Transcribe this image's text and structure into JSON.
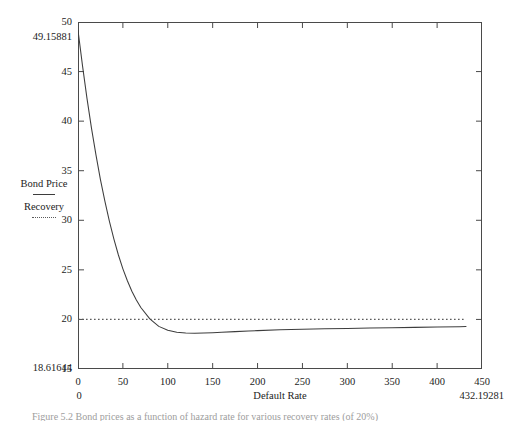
{
  "chart_data": {
    "type": "line",
    "title": "",
    "xlabel": "Default Rate",
    "ylabel": "",
    "xlim": [
      0,
      450
    ],
    "ylim": [
      15,
      50
    ],
    "grid": false,
    "legend_position": "left-outside",
    "xticks": [
      "0",
      "50",
      "100",
      "150",
      "200",
      "250",
      "300",
      "350",
      "400",
      "450"
    ],
    "xtick_values": [
      0,
      50,
      100,
      150,
      200,
      250,
      300,
      350,
      400,
      450
    ],
    "yticks": [
      "50",
      "45",
      "40",
      "35",
      "30",
      "25",
      "20",
      "15"
    ],
    "ytick_values": [
      50,
      45,
      40,
      35,
      30,
      25,
      20,
      15
    ],
    "annotations": {
      "y_max_value": "49.15881",
      "y_min_value": "18.61644",
      "x_min_value": "0",
      "x_max_value": "432.19281"
    },
    "series": [
      {
        "name": "Bond Price",
        "style": "solid",
        "color": "#3d3d3d",
        "x": [
          0,
          5,
          10,
          15,
          20,
          25,
          30,
          35,
          40,
          45,
          50,
          55,
          60,
          65,
          70,
          80,
          90,
          100,
          110,
          120,
          130,
          140,
          150,
          160,
          175,
          190,
          200,
          225,
          250,
          275,
          300,
          325,
          350,
          375,
          400,
          425,
          432.19281
        ],
        "y": [
          49.15881,
          45.6,
          42.3,
          39.3,
          36.6,
          34.1,
          31.9,
          29.9,
          28.1,
          26.5,
          25.1,
          23.9,
          22.85,
          21.95,
          21.2,
          20.05,
          19.3,
          18.9,
          18.7,
          18.63,
          18.61644,
          18.63,
          18.66,
          18.7,
          18.77,
          18.83,
          18.87,
          18.95,
          19.0,
          19.05,
          19.09,
          19.13,
          19.17,
          19.2,
          19.23,
          19.27,
          19.28
        ]
      },
      {
        "name": "Recovery",
        "style": "dotted",
        "color": "#5a5a5a",
        "constant_y": 20,
        "x": [
          0,
          432.19281
        ],
        "y": [
          20,
          20
        ]
      }
    ]
  },
  "legend": {
    "entries": [
      {
        "label": "Bond Price",
        "style": "solid"
      },
      {
        "label": "Recovery",
        "style": "dotted"
      }
    ]
  },
  "caption": {
    "text": "Figure 5.2  Bond prices as a function of hazard rate for various recovery rates (of 20%)"
  }
}
